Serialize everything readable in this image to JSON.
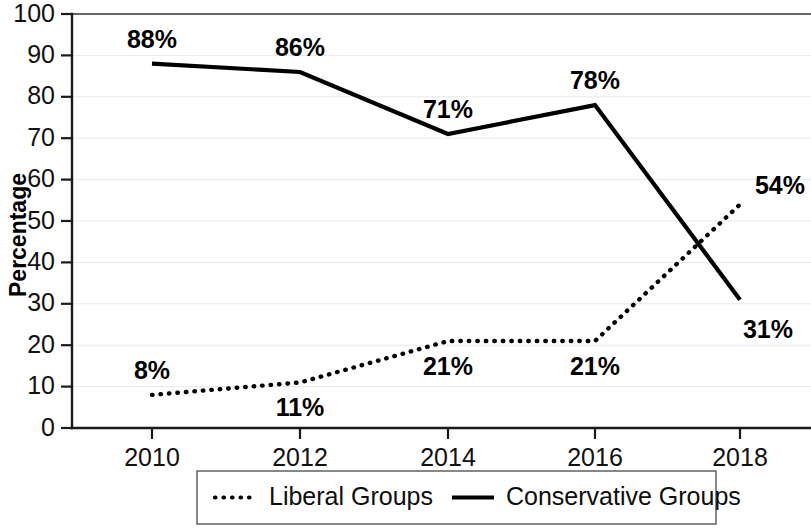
{
  "chart_data": {
    "type": "line",
    "title": "",
    "xlabel": "",
    "ylabel": "Percentage",
    "categories": [
      "2010",
      "2012",
      "2014",
      "2016",
      "2018"
    ],
    "x": [
      2010,
      2012,
      2014,
      2016,
      2018
    ],
    "xlim": [
      2009.2,
      2018.6
    ],
    "ylim": [
      0,
      100
    ],
    "ytick_labels": [
      "0",
      "10",
      "20",
      "30",
      "40",
      "50",
      "60",
      "70",
      "80",
      "90",
      "100"
    ],
    "yticks": [
      0,
      10,
      20,
      30,
      40,
      50,
      60,
      70,
      80,
      90,
      100
    ],
    "grid": true,
    "grid_axis": "y",
    "legend_position": "bottom-center",
    "series": [
      {
        "name": "Liberal Groups",
        "style": "dotted",
        "color": "#000000",
        "values": [
          8,
          11,
          21,
          21,
          54
        ],
        "point_labels": [
          "8%",
          "11%",
          "21%",
          "21%",
          "54%"
        ],
        "label_placement": [
          "above",
          "below",
          "below",
          "below",
          "right-above"
        ]
      },
      {
        "name": "Conservative Groups",
        "style": "solid",
        "color": "#000000",
        "values": [
          88,
          86,
          71,
          78,
          31
        ],
        "point_labels": [
          "88%",
          "86%",
          "71%",
          "78%",
          "31%"
        ],
        "label_placement": [
          "above",
          "above",
          "above",
          "above",
          "below-right"
        ]
      }
    ]
  },
  "legend": {
    "entries": [
      {
        "label": "Liberal Groups",
        "style": "dotted"
      },
      {
        "label": "Conservative Groups",
        "style": "solid"
      }
    ]
  },
  "axes": {
    "y_title": "Percentage"
  }
}
